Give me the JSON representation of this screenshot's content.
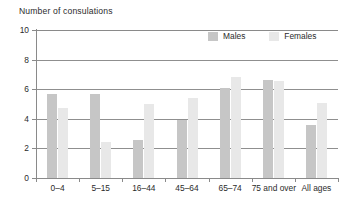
{
  "chart_data": {
    "type": "bar",
    "title": "Number of consulations",
    "xlabel": "",
    "ylabel": "",
    "ylim": [
      0,
      10
    ],
    "yticks": [
      0,
      2,
      4,
      6,
      8,
      10
    ],
    "grid": true,
    "legend_position": "top-right",
    "categories": [
      "0–4",
      "5–15",
      "16–44",
      "45–64",
      "65–74",
      "75 and over",
      "All ages"
    ],
    "series": [
      {
        "name": "Males",
        "color": "#c6c6c6",
        "values": [
          5.7,
          5.7,
          2.6,
          3.9,
          6.05,
          6.65,
          3.6
        ]
      },
      {
        "name": "Females",
        "color": "#e8e8e8",
        "values": [
          4.7,
          2.4,
          5.0,
          5.4,
          6.8,
          6.55,
          5.05
        ]
      }
    ]
  },
  "legend": {
    "items": [
      {
        "label": "Males",
        "swatch": "males-swatch"
      },
      {
        "label": "Females",
        "swatch": "females-swatch"
      }
    ]
  },
  "axis": {
    "y_tick_labels": [
      "10",
      "8",
      "6",
      "4",
      "2",
      "0"
    ],
    "x_tick_labels": [
      "0–4",
      "5–15",
      "16–44",
      "45–64",
      "65–74",
      "75 and over",
      "All ages"
    ]
  },
  "colors": {
    "males": "#c6c6c6",
    "females": "#e8e8e8",
    "axis": "#8a8a8a",
    "grid": "#8f8f8f",
    "text": "#2b2b2b",
    "background": "#ffffff"
  }
}
